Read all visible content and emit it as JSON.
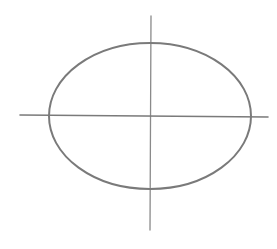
{
  "diagram": {
    "type": "ellipse-sketch",
    "stroke_color": "#7a7a7a",
    "axis_color": "#8a8a8a",
    "background": "#ffffff",
    "ellipse": {
      "cx": 150,
      "cy": 116,
      "rx": 101,
      "ry": 73
    },
    "vertical_axis": {
      "x1": 151,
      "y1": 16,
      "x2": 150,
      "y2": 230
    },
    "horizontal_axis": {
      "x1": 20,
      "y1": 115,
      "x2": 268,
      "y2": 117
    }
  }
}
